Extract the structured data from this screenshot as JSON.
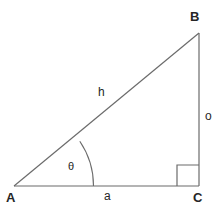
{
  "diagram": {
    "type": "right-triangle",
    "background_color": "#ffffff",
    "stroke_color": "#6b6b6b",
    "text_color": "#262626",
    "vertices": [
      {
        "id": "A",
        "label": "A",
        "x": 14,
        "y": 186,
        "role": "acute-angle-theta"
      },
      {
        "id": "B",
        "label": "B",
        "x": 199,
        "y": 33,
        "role": "acute-angle"
      },
      {
        "id": "C",
        "label": "C",
        "x": 199,
        "y": 186,
        "role": "right-angle"
      }
    ],
    "sides": [
      {
        "id": "hypotenuse",
        "label": "h",
        "from": "A",
        "to": "B"
      },
      {
        "id": "opposite",
        "label": "o",
        "from": "B",
        "to": "C"
      },
      {
        "id": "adjacent",
        "label": "a",
        "from": "A",
        "to": "C"
      }
    ],
    "angles": [
      {
        "id": "theta",
        "label": "θ",
        "at": "A",
        "marker": "arc"
      },
      {
        "id": "right-angle",
        "label": "",
        "at": "C",
        "marker": "square"
      }
    ],
    "markers": {
      "angle_arc_radius": 80,
      "right_angle_box_size": 22
    }
  }
}
